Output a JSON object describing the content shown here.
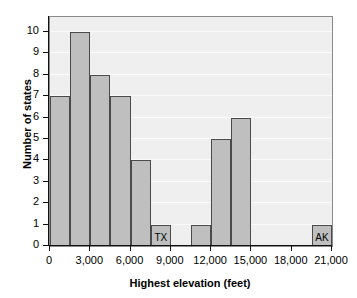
{
  "chart_data": {
    "type": "bar",
    "title": "",
    "xlabel": "Highest elevation (feet)",
    "ylabel": "Number of states",
    "xlim": [
      0,
      21000
    ],
    "ylim": [
      0,
      10.7
    ],
    "bin_width": 1500,
    "grid": true,
    "legend": "none",
    "bar_color": "#bfbfbf",
    "bar_edge_color": "#4a4a4a",
    "plot_bg_color": "#efefef",
    "x_tick_labels": [
      "0",
      "3,000",
      "6,000",
      "9,000",
      "12,000",
      "15,000",
      "18,000",
      "21,000"
    ],
    "x_tick_values": [
      0,
      3000,
      6000,
      9000,
      12000,
      15000,
      18000,
      21000
    ],
    "y_tick_labels": [
      "0",
      "1",
      "2",
      "3",
      "4",
      "5",
      "6",
      "7",
      "8",
      "9",
      "10"
    ],
    "y_tick_values": [
      0,
      1,
      2,
      3,
      4,
      5,
      6,
      7,
      8,
      9,
      10
    ],
    "categories": [
      "0-1,500",
      "1,500-3,000",
      "3,000-4,500",
      "4,500-6,000",
      "6,000-7,500",
      "7,500-9,000",
      "9,000-10,500",
      "10,500-12,000",
      "12,000-13,500",
      "13,500-15,000",
      "15,000-16,500",
      "16,500-18,000",
      "18,000-19,500",
      "19,500-21,000"
    ],
    "bins": [
      {
        "start": 0,
        "end": 1500,
        "value": 7,
        "label": ""
      },
      {
        "start": 1500,
        "end": 3000,
        "value": 10,
        "label": ""
      },
      {
        "start": 3000,
        "end": 4500,
        "value": 8,
        "label": ""
      },
      {
        "start": 4500,
        "end": 6000,
        "value": 7,
        "label": ""
      },
      {
        "start": 6000,
        "end": 7500,
        "value": 4,
        "label": ""
      },
      {
        "start": 7500,
        "end": 9000,
        "value": 1,
        "label": "TX"
      },
      {
        "start": 9000,
        "end": 10500,
        "value": 0,
        "label": ""
      },
      {
        "start": 10500,
        "end": 12000,
        "value": 1,
        "label": ""
      },
      {
        "start": 12000,
        "end": 13500,
        "value": 5,
        "label": ""
      },
      {
        "start": 13500,
        "end": 15000,
        "value": 6,
        "label": ""
      },
      {
        "start": 15000,
        "end": 16500,
        "value": 0,
        "label": ""
      },
      {
        "start": 16500,
        "end": 18000,
        "value": 0,
        "label": ""
      },
      {
        "start": 18000,
        "end": 19500,
        "value": 0,
        "label": ""
      },
      {
        "start": 19500,
        "end": 21000,
        "value": 1,
        "label": "AK"
      }
    ],
    "values": [
      7,
      10,
      8,
      7,
      4,
      1,
      0,
      1,
      5,
      6,
      0,
      0,
      0,
      1
    ],
    "annotations": [
      {
        "text": "TX",
        "bin_index": 5
      },
      {
        "text": "AK",
        "bin_index": 13
      }
    ]
  }
}
